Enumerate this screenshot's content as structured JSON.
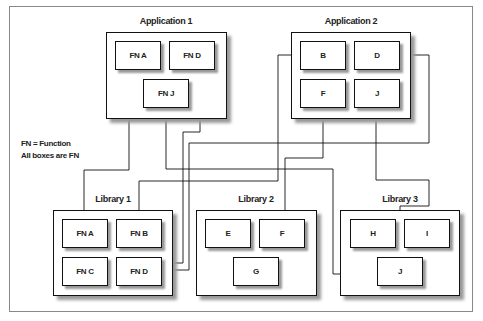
{
  "legend": {
    "line1": "FN = Function",
    "line2": "All boxes are FN"
  },
  "groups": {
    "app1": {
      "label": "Application 1",
      "boxes": [
        "FN A",
        "FN D",
        "FN J"
      ]
    },
    "app2": {
      "label": "Application 2",
      "boxes": [
        "B",
        "D",
        "F",
        "J"
      ]
    },
    "lib1": {
      "label": "Library 1",
      "boxes": [
        "FN A",
        "FN B",
        "FN C",
        "FN D"
      ]
    },
    "lib2": {
      "label": "Library 2",
      "boxes": [
        "E",
        "F",
        "G"
      ]
    },
    "lib3": {
      "label": "Library 3",
      "boxes": [
        "H",
        "I",
        "J"
      ]
    }
  },
  "connections": [
    {
      "from": "Library 1 / FN A",
      "to": "Application 1 / FN A"
    },
    {
      "from": "Library 1 / FN D",
      "to": "Application 1 / FN D"
    },
    {
      "from": "Library 3 / J",
      "to": "Application 1 / FN J"
    },
    {
      "from": "Library 1 / FN B",
      "to": "Application 2 / B"
    },
    {
      "from": "Library 1 / FN D",
      "to": "Application 2 / D"
    },
    {
      "from": "Library 2 / F",
      "to": "Application 2 / F"
    },
    {
      "from": "Library 3 / J",
      "to": "Application 2 / J"
    }
  ],
  "colors": {
    "line": "#111111",
    "shadow": "#999999",
    "frame": "#888888"
  }
}
